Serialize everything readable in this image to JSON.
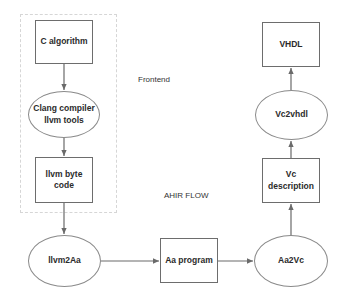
{
  "diagram": {
    "labels": {
      "frontend": "Frontend",
      "flow": "AHIR FLOW"
    },
    "nodes": {
      "c_algorithm": {
        "line1": "C algorithm",
        "line2": ""
      },
      "clang": {
        "line1": "Clang compiler",
        "line2": "llvm tools"
      },
      "llvm_byte_code": {
        "line1": "llvm byte",
        "line2": "code"
      },
      "llvm2aa": {
        "line1": "llvm2Aa",
        "line2": ""
      },
      "aa_program": {
        "line1": "Aa program",
        "line2": ""
      },
      "aa2vc": {
        "line1": "Aa2Vc",
        "line2": ""
      },
      "vc_description": {
        "line1": "Vc",
        "line2": "description"
      },
      "vc2vhdl": {
        "line1": "Vc2vhdl",
        "line2": ""
      },
      "vhdl": {
        "line1": "VHDL",
        "line2": ""
      }
    },
    "edges": [
      {
        "from": "C algorithm",
        "to": "Clang compiler llvm tools"
      },
      {
        "from": "Clang compiler llvm tools",
        "to": "llvm byte code"
      },
      {
        "from": "llvm byte code",
        "to": "llvm2Aa"
      },
      {
        "from": "llvm2Aa",
        "to": "Aa program"
      },
      {
        "from": "Aa program",
        "to": "Aa2Vc"
      },
      {
        "from": "Aa2Vc",
        "to": "Vc description"
      },
      {
        "from": "Vc description",
        "to": "Vc2vhdl"
      },
      {
        "from": "Vc2vhdl",
        "to": "VHDL"
      }
    ],
    "colors": {
      "line": "#6a6a6a",
      "text": "#2b2b2b",
      "frame": "#d6d6d6"
    }
  }
}
